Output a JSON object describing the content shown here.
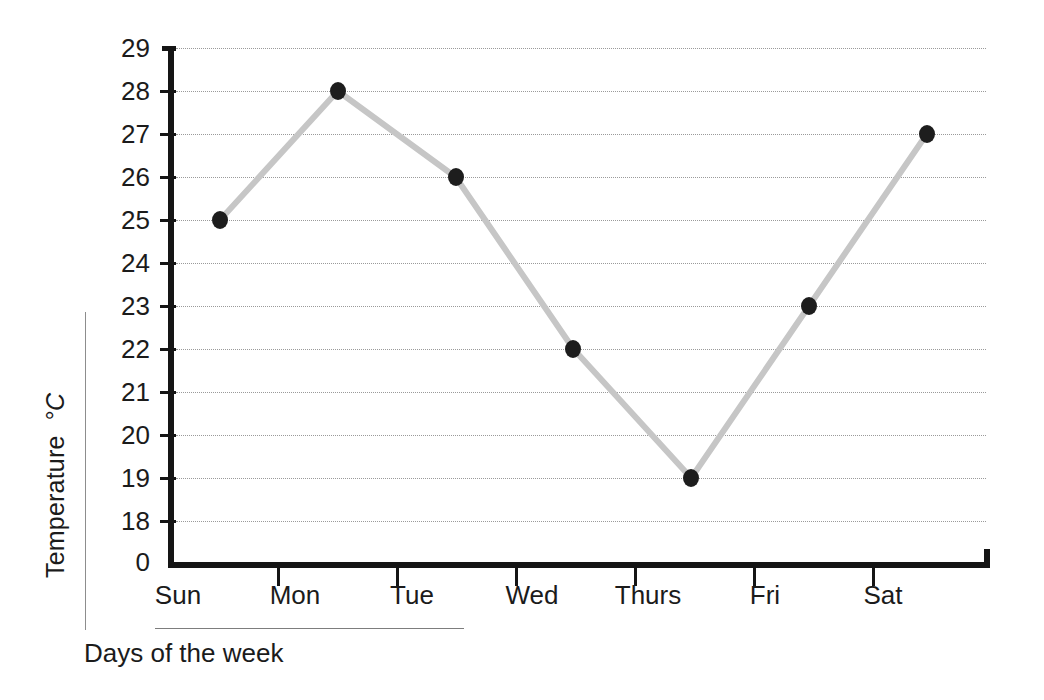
{
  "chart_data": {
    "type": "line",
    "title": "",
    "categories": [
      "Sun",
      "Mon",
      "Tue",
      "Wed",
      "Thurs",
      "Fri",
      "Sat"
    ],
    "values": [
      25,
      28,
      26,
      22,
      19,
      23,
      27
    ],
    "xlabel": "Days of the week",
    "ylabel": "Temperature",
    "ylabel_unit": "°C",
    "yticks": [
      "29",
      "28",
      "27",
      "26",
      "25",
      "24",
      "23",
      "22",
      "21",
      "20",
      "19",
      "18",
      "0"
    ],
    "ylim": [
      18,
      29
    ],
    "y_axis_break": true,
    "y_baseline_label": "0",
    "grid": "horizontal-dotted",
    "legend": "none",
    "series": [
      {
        "name": "Temperature",
        "values": [
          25,
          28,
          26,
          22,
          19,
          23,
          27
        ],
        "line_color": "#c6c6c6",
        "marker_color": "#1d1d1d",
        "marker": "circle"
      }
    ],
    "points": [
      {
        "category": "Sun",
        "value": 25
      },
      {
        "category": "Mon",
        "value": 28
      },
      {
        "category": "Tue",
        "value": 26
      },
      {
        "category": "Wed",
        "value": 22
      },
      {
        "category": "Thurs",
        "value": 19
      },
      {
        "category": "Fri",
        "value": 23
      },
      {
        "category": "Sat",
        "value": 27
      }
    ]
  },
  "colors": {
    "axis": "#151515",
    "grid": "#9a9a9a",
    "line": "#c6c6c6",
    "marker": "#1d1d1d",
    "text": "#1b1b1b",
    "background": "#ffffff"
  }
}
